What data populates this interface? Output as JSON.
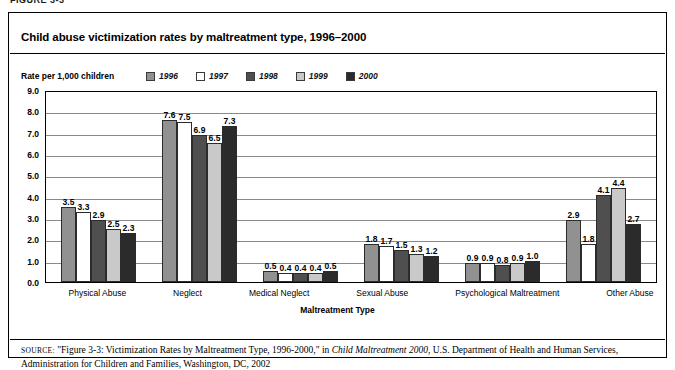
{
  "figure_caption": "FIGURE 3-3",
  "chart_title": "Child abuse victimization rates by maltreatment type, 1996–2000",
  "axis_note": "Rate per 1,000 children",
  "xaxis_title": "Maltreatment Type",
  "source": {
    "label": "SOURCE:",
    "text_before_italic": " \"Figure 3-3: Victimization Rates by Maltreatment Type, 1996-2000,\" in ",
    "italic_title": "Child Maltreatment 2000",
    "text_after_italic": ", U.S. Department of Health and Human Services, Administration for Children and Families, Washington, DC, 2002"
  },
  "chart_data": {
    "type": "bar",
    "title": "Child abuse victimization rates by maltreatment type, 1996–2000",
    "xlabel": "Maltreatment Type",
    "ylabel": "Rate per 1,000 children",
    "ylim": [
      0,
      9
    ],
    "ytick_labels": [
      "9.0",
      "8.0",
      "7.0",
      "6.0",
      "5.0",
      "4.0",
      "3.0",
      "2.0",
      "1.0",
      "0.0"
    ],
    "ytick_values": [
      9,
      8,
      7,
      6,
      5,
      4,
      3,
      2,
      1,
      0
    ],
    "grid": true,
    "legend_position": "top",
    "categories": [
      "Physical Abuse",
      "Neglect",
      "Medical Neglect",
      "Sexual Abuse",
      "Psychological Maltreatment",
      "Other Abuse"
    ],
    "series": [
      {
        "name": "1996",
        "color": "#919191",
        "values": [
          3.5,
          7.6,
          0.5,
          1.8,
          0.9,
          2.9
        ]
      },
      {
        "name": "1997",
        "color": "#ffffff",
        "values": [
          3.3,
          7.5,
          0.4,
          1.7,
          0.9,
          1.8
        ]
      },
      {
        "name": "1998",
        "color": "#4f4f4f",
        "values": [
          2.9,
          6.9,
          0.4,
          1.5,
          0.8,
          4.1
        ]
      },
      {
        "name": "1999",
        "color": "#c9c9c9",
        "values": [
          2.5,
          6.5,
          0.4,
          1.3,
          0.9,
          4.4
        ]
      },
      {
        "name": "2000",
        "color": "#2b2b2b",
        "values": [
          2.3,
          7.3,
          0.5,
          1.2,
          1.0,
          2.7
        ]
      }
    ]
  }
}
